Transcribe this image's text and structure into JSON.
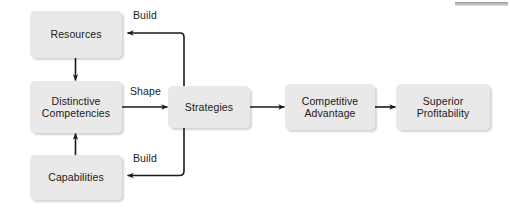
{
  "diagram": {
    "type": "flow-diagram",
    "background_color": "#ffffff",
    "node_fill_color": "#e9e9e9",
    "edge_color": "#1a1a1a",
    "text_color": "#1a1a1a",
    "nodes": [
      {
        "id": "resources",
        "label": "Resources"
      },
      {
        "id": "distinctive-competencies",
        "label": "Distinctive\nCompetencies"
      },
      {
        "id": "capabilities",
        "label": "Capabilities"
      },
      {
        "id": "strategies",
        "label": "Strategies"
      },
      {
        "id": "competitive-advantage",
        "label": "Competitive\nAdvantage"
      },
      {
        "id": "superior-profitability",
        "label": "Superior\nProfitability"
      }
    ],
    "edges": [
      {
        "id": "resources-to-competencies",
        "from": "resources",
        "to": "distinctive-competencies",
        "label": ""
      },
      {
        "id": "capabilities-to-competencies",
        "from": "capabilities",
        "to": "distinctive-competencies",
        "label": ""
      },
      {
        "id": "competencies-to-strategies",
        "from": "distinctive-competencies",
        "to": "strategies",
        "label": "Shape"
      },
      {
        "id": "strategies-to-resources",
        "from": "strategies",
        "to": "resources",
        "label": "Build"
      },
      {
        "id": "strategies-to-capabilities",
        "from": "strategies",
        "to": "capabilities",
        "label": "Build"
      },
      {
        "id": "strategies-to-advantage",
        "from": "strategies",
        "to": "competitive-advantage",
        "label": ""
      },
      {
        "id": "advantage-to-profitability",
        "from": "competitive-advantage",
        "to": "superior-profitability",
        "label": ""
      }
    ],
    "edge_labels": {
      "build_top": "Build",
      "build_bottom": "Build",
      "shape": "Shape"
    }
  }
}
